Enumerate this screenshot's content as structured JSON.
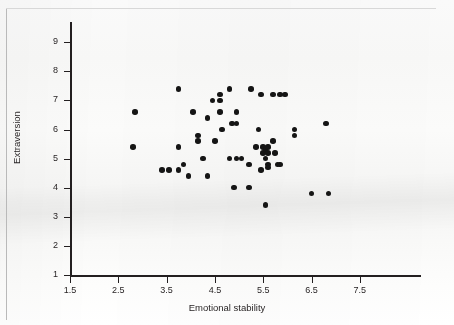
{
  "chart_data": {
    "type": "scatter",
    "title": "",
    "xlabel": "Emotional stability",
    "ylabel": "Extraversion",
    "xlim": [
      1.5,
      8.2
    ],
    "ylim": [
      1,
      9.5
    ],
    "xticks": [
      1.5,
      2.5,
      3.5,
      4.5,
      5.5,
      6.5,
      7.5
    ],
    "xtick_labels": [
      "1.5",
      "2.5",
      "3.5",
      "4.5",
      "5.5",
      "6.5",
      "7.5"
    ],
    "yticks": [
      1,
      2,
      3,
      4,
      5,
      6,
      7,
      8,
      9
    ],
    "ytick_labels": [
      "1",
      "2",
      "3",
      "4",
      "5",
      "6",
      "7",
      "8",
      "9"
    ],
    "grid": false,
    "legend": false,
    "marker_color": "#151515",
    "marker": "circle",
    "series": [
      {
        "name": "participants",
        "points": [
          [
            2.85,
            6.6
          ],
          [
            2.8,
            5.4
          ],
          [
            3.4,
            4.6
          ],
          [
            3.55,
            4.6
          ],
          [
            3.75,
            7.4
          ],
          [
            3.75,
            5.4
          ],
          [
            3.75,
            4.6
          ],
          [
            3.85,
            4.8
          ],
          [
            3.95,
            4.4
          ],
          [
            4.05,
            6.6
          ],
          [
            4.15,
            5.8
          ],
          [
            4.15,
            5.6
          ],
          [
            4.25,
            5.0
          ],
          [
            4.35,
            6.4
          ],
          [
            4.35,
            4.4
          ],
          [
            4.45,
            7.0
          ],
          [
            4.5,
            5.6
          ],
          [
            4.6,
            7.2
          ],
          [
            4.6,
            6.6
          ],
          [
            4.6,
            7.0
          ],
          [
            4.65,
            6.0
          ],
          [
            4.8,
            7.4
          ],
          [
            4.85,
            6.2
          ],
          [
            4.95,
            6.6
          ],
          [
            4.95,
            6.2
          ],
          [
            4.95,
            5.0
          ],
          [
            4.9,
            4.0
          ],
          [
            4.8,
            5.0
          ],
          [
            5.05,
            5.0
          ],
          [
            5.25,
            7.4
          ],
          [
            5.2,
            4.8
          ],
          [
            5.2,
            4.0
          ],
          [
            5.45,
            7.2
          ],
          [
            5.4,
            6.0
          ],
          [
            5.35,
            5.4
          ],
          [
            5.45,
            4.6
          ],
          [
            5.5,
            5.4
          ],
          [
            5.5,
            5.2
          ],
          [
            5.55,
            5.3
          ],
          [
            5.6,
            5.4
          ],
          [
            5.6,
            5.2
          ],
          [
            5.55,
            5.0
          ],
          [
            5.6,
            4.8
          ],
          [
            5.6,
            4.7
          ],
          [
            5.55,
            3.4
          ],
          [
            5.7,
            7.2
          ],
          [
            5.7,
            5.6
          ],
          [
            5.75,
            5.2
          ],
          [
            5.8,
            4.8
          ],
          [
            5.85,
            4.8
          ],
          [
            5.85,
            7.2
          ],
          [
            5.95,
            7.2
          ],
          [
            6.15,
            6.0
          ],
          [
            6.15,
            5.8
          ],
          [
            6.5,
            3.8
          ],
          [
            6.8,
            6.2
          ],
          [
            6.85,
            3.8
          ]
        ]
      }
    ]
  },
  "axes": {
    "x_title": "Emotional stability",
    "y_title": "Extraversion"
  }
}
